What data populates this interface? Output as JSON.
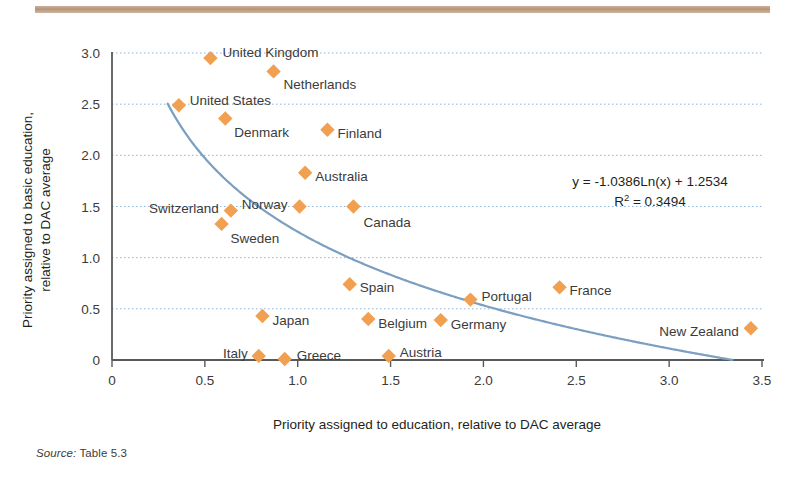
{
  "figure": {
    "top_rule_color": "#b08f74",
    "source_prefix": "Source:",
    "source_text": " Table 5.3"
  },
  "chart_data": {
    "type": "scatter",
    "title": "",
    "xlabel": "Priority assigned to education, relative to DAC average",
    "ylabel_line1": "Priority assigned to basic education,",
    "ylabel_line2": "relative to DAC average",
    "xlim": [
      0,
      3.5
    ],
    "ylim": [
      0,
      3.0
    ],
    "xticks": [
      "0",
      "0.5",
      "1.0",
      "1.5",
      "2.0",
      "2.5",
      "3.0",
      "3.5"
    ],
    "xtick_values": [
      0,
      0.5,
      1.0,
      1.5,
      2.0,
      2.5,
      3.0,
      3.5
    ],
    "yticks": [
      "0",
      "0.5",
      "1.0",
      "1.5",
      "2.0",
      "2.5",
      "3.0"
    ],
    "ytick_values": [
      0,
      0.5,
      1.0,
      1.5,
      2.0,
      2.5,
      3.0
    ],
    "grid": "horizontal-dotted",
    "legend": "none",
    "marker_color": "#f0a050",
    "marker_shape": "diamond",
    "trendline_color": "#7a9fc0",
    "trendline_type": "logarithmic",
    "annotation_equation": "y = -1.0386Ln(x) + 1.2534",
    "annotation_r2_prefix": "R",
    "annotation_r2_sup": "2",
    "annotation_r2_value": " = 0.3494",
    "points": [
      {
        "label": "United Kingdom",
        "x": 0.53,
        "y": 2.95,
        "lx": 12,
        "ly": -5,
        "anchor": "start"
      },
      {
        "label": "Netherlands",
        "x": 0.87,
        "y": 2.82,
        "lx": 10,
        "ly": 14,
        "anchor": "start"
      },
      {
        "label": "United States",
        "x": 0.36,
        "y": 2.49,
        "lx": 11,
        "ly": -4,
        "anchor": "start"
      },
      {
        "label": "Denmark",
        "x": 0.61,
        "y": 2.36,
        "lx": 9,
        "ly": 15,
        "anchor": "start"
      },
      {
        "label": "Finland",
        "x": 1.16,
        "y": 2.25,
        "lx": 10,
        "ly": 4,
        "anchor": "start"
      },
      {
        "label": "Australia",
        "x": 1.04,
        "y": 1.83,
        "lx": 10,
        "ly": 4,
        "anchor": "start"
      },
      {
        "label": "Switzerland",
        "x": 0.64,
        "y": 1.46,
        "lx": -12,
        "ly": -2,
        "anchor": "end"
      },
      {
        "label": "Norway",
        "x": 1.01,
        "y": 1.5,
        "lx": -12,
        "ly": -2,
        "anchor": "end"
      },
      {
        "label": "Sweden",
        "x": 0.59,
        "y": 1.33,
        "lx": 9,
        "ly": 15,
        "anchor": "start"
      },
      {
        "label": "Canada",
        "x": 1.3,
        "y": 1.5,
        "lx": 10,
        "ly": 16,
        "anchor": "start"
      },
      {
        "label": "Spain",
        "x": 1.28,
        "y": 0.74,
        "lx": 10,
        "ly": 4,
        "anchor": "start"
      },
      {
        "label": "Portugal",
        "x": 1.93,
        "y": 0.59,
        "lx": 11,
        "ly": -3,
        "anchor": "start"
      },
      {
        "label": "France",
        "x": 2.41,
        "y": 0.71,
        "lx": 10,
        "ly": 4,
        "anchor": "start"
      },
      {
        "label": "Japan",
        "x": 0.81,
        "y": 0.43,
        "lx": 10,
        "ly": 5,
        "anchor": "start"
      },
      {
        "label": "Belgium",
        "x": 1.38,
        "y": 0.4,
        "lx": 10,
        "ly": 5,
        "anchor": "start"
      },
      {
        "label": "Germany",
        "x": 1.77,
        "y": 0.39,
        "lx": 10,
        "ly": 5,
        "anchor": "start"
      },
      {
        "label": "New Zealand",
        "x": 3.44,
        "y": 0.31,
        "lx": -12,
        "ly": 4,
        "anchor": "end"
      },
      {
        "label": "Italy",
        "x": 0.79,
        "y": 0.04,
        "lx": -11,
        "ly": -2,
        "anchor": "end"
      },
      {
        "label": "Greece",
        "x": 0.93,
        "y": 0.01,
        "lx": 12,
        "ly": -3,
        "anchor": "start"
      },
      {
        "label": "Austria",
        "x": 1.49,
        "y": 0.04,
        "lx": 11,
        "ly": -3,
        "anchor": "start"
      }
    ]
  }
}
